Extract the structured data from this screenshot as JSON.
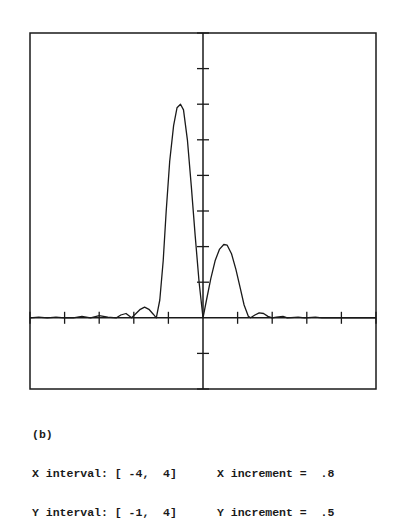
{
  "chart_data": {
    "type": "line",
    "title": "",
    "panel_label": "(b)",
    "xlabel": "",
    "ylabel": "",
    "xlim": [
      -4,
      4
    ],
    "ylim": [
      -1,
      4
    ],
    "x_increment": 0.8,
    "y_increment": 0.5,
    "grid": false,
    "axes_through_origin": true,
    "series": [
      {
        "name": "f(x)",
        "points": [
          [
            -4.0,
            0.0
          ],
          [
            -3.8,
            0.01
          ],
          [
            -3.6,
            0.0
          ],
          [
            -3.4,
            0.01
          ],
          [
            -3.2,
            0.0
          ],
          [
            -3.0,
            0.0
          ],
          [
            -2.8,
            0.02
          ],
          [
            -2.6,
            0.0
          ],
          [
            -2.4,
            0.03
          ],
          [
            -2.2,
            0.01
          ],
          [
            -2.0,
            0.0
          ],
          [
            -1.9,
            0.04
          ],
          [
            -1.78,
            0.06
          ],
          [
            -1.65,
            0.0
          ],
          [
            -1.55,
            0.06
          ],
          [
            -1.45,
            0.12
          ],
          [
            -1.35,
            0.15
          ],
          [
            -1.25,
            0.12
          ],
          [
            -1.15,
            0.05
          ],
          [
            -1.08,
            0.0
          ],
          [
            -1.0,
            0.25
          ],
          [
            -0.92,
            0.8
          ],
          [
            -0.85,
            1.5
          ],
          [
            -0.77,
            2.2
          ],
          [
            -0.68,
            2.7
          ],
          [
            -0.6,
            2.95
          ],
          [
            -0.52,
            3.0
          ],
          [
            -0.45,
            2.92
          ],
          [
            -0.36,
            2.5
          ],
          [
            -0.27,
            1.85
          ],
          [
            -0.18,
            1.15
          ],
          [
            -0.09,
            0.5
          ],
          [
            0.0,
            0.0
          ],
          [
            0.08,
            0.25
          ],
          [
            0.18,
            0.55
          ],
          [
            0.28,
            0.8
          ],
          [
            0.38,
            0.96
          ],
          [
            0.48,
            1.03
          ],
          [
            0.56,
            1.02
          ],
          [
            0.66,
            0.9
          ],
          [
            0.76,
            0.68
          ],
          [
            0.86,
            0.42
          ],
          [
            0.95,
            0.18
          ],
          [
            1.05,
            0.02
          ],
          [
            1.1,
            0.0
          ],
          [
            1.2,
            0.04
          ],
          [
            1.3,
            0.07
          ],
          [
            1.4,
            0.06
          ],
          [
            1.5,
            0.02
          ],
          [
            1.6,
            0.0
          ],
          [
            1.7,
            0.01
          ],
          [
            1.85,
            0.02
          ],
          [
            1.95,
            0.0
          ],
          [
            2.2,
            0.01
          ],
          [
            2.35,
            0.0
          ],
          [
            2.6,
            0.01
          ],
          [
            2.75,
            0.0
          ],
          [
            3.0,
            0.0
          ],
          [
            3.4,
            0.0
          ],
          [
            4.0,
            0.0
          ]
        ]
      }
    ]
  },
  "caption": {
    "label": "(b)",
    "x_interval_label": "X interval: [ -4,  4]",
    "y_interval_label": "Y interval: [ -1,  4]",
    "x_increment_label": "X increment =  .8",
    "y_increment_label": "Y increment =  .5"
  },
  "colors": {
    "line": "#1a1a1a",
    "background": "#ffffff"
  }
}
